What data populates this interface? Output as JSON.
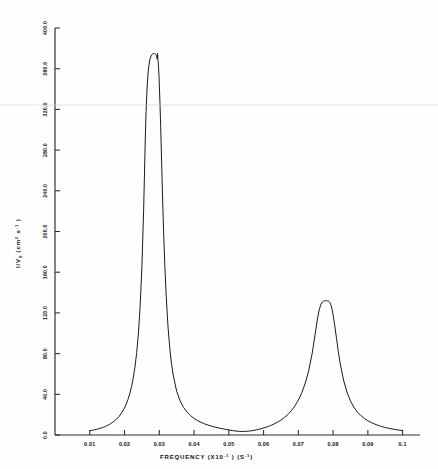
{
  "chart_data": {
    "type": "line",
    "title": "",
    "xlabel": "FREQUENCY (X10-1 ) (S-1)",
    "xlabel_parts": {
      "name": "FREQUENCY",
      "unit_mantissa": "(X10",
      "unit_exp": "-1",
      "unit_close": " )",
      "unit2_open": "(S",
      "unit2_exp": "-1",
      "unit2_close": ")"
    },
    "ylabel": "I/V0 (cm 2 s -1 )",
    "ylabel_parts": {
      "symbol": "I/",
      "subject": "V",
      "subscript": "0",
      "unit_open": " (cm",
      "unit_exp": "2",
      "unit_mid": " s",
      "unit_exp2": "-1",
      "unit_close": " )"
    },
    "xlim": [
      0.0,
      0.105
    ],
    "ylim": [
      0.0,
      400.0
    ],
    "xticks": [
      0.01,
      0.02,
      0.03,
      0.04,
      0.05,
      0.06,
      0.07,
      0.08,
      0.09,
      0.1
    ],
    "xtick_labels": [
      "0.01",
      "0.02",
      "0.03",
      "0.04",
      "0.05",
      "0.06",
      "0.07",
      "0.08",
      "0.09",
      "0.1"
    ],
    "yticks": [
      0.0,
      40.0,
      80.0,
      120.0,
      160.0,
      200.0,
      240.0,
      280.0,
      320.0,
      360.0,
      400.0
    ],
    "ytick_labels": [
      "0.0",
      "40.0",
      "80.0",
      "120.0",
      "160.0",
      "200.0",
      "240.0",
      "280.0",
      "320.0",
      "360.0",
      "400.0"
    ],
    "grid": false,
    "legend": false,
    "series": [
      {
        "name": "spectrum",
        "color": "#1a1a1a",
        "peaks": [
          {
            "center": 0.0295,
            "height": 375.0,
            "hwhm": 0.00125
          },
          {
            "center": 0.0785,
            "height": 132.0,
            "hwhm": 0.00235
          }
        ],
        "x": [
          0.01,
          0.0105,
          0.011,
          0.0115,
          0.012,
          0.0125,
          0.013,
          0.0135,
          0.014,
          0.0145,
          0.015,
          0.0155,
          0.016,
          0.0165,
          0.017,
          0.0175,
          0.018,
          0.0185,
          0.019,
          0.0195,
          0.02,
          0.0205,
          0.021,
          0.0215,
          0.022,
          0.0225,
          0.023,
          0.0235,
          0.024,
          0.0245,
          0.025,
          0.0255,
          0.026,
          0.0262,
          0.0265,
          0.0268,
          0.027,
          0.0273,
          0.0275,
          0.0278,
          0.028,
          0.0282,
          0.0284,
          0.0286,
          0.0288,
          0.029,
          0.0291,
          0.0292,
          0.0293,
          0.0294,
          0.0295,
          0.0296,
          0.0297,
          0.0298,
          0.0299,
          0.03,
          0.0302,
          0.0304,
          0.0306,
          0.0308,
          0.031,
          0.0313,
          0.0316,
          0.032,
          0.0325,
          0.033,
          0.0335,
          0.034,
          0.035,
          0.036,
          0.037,
          0.038,
          0.039,
          0.04,
          0.041,
          0.042,
          0.043,
          0.044,
          0.045,
          0.046,
          0.047,
          0.048,
          0.049,
          0.05,
          0.051,
          0.0515,
          0.052,
          0.053,
          0.054,
          0.055,
          0.056,
          0.057,
          0.058,
          0.059,
          0.06,
          0.061,
          0.062,
          0.063,
          0.064,
          0.065,
          0.066,
          0.067,
          0.068,
          0.069,
          0.07,
          0.071,
          0.072,
          0.073,
          0.074,
          0.075,
          0.0755,
          0.076,
          0.0765,
          0.077,
          0.0773,
          0.0776,
          0.0779,
          0.0781,
          0.0783,
          0.0785,
          0.0787,
          0.0789,
          0.0791,
          0.0794,
          0.0797,
          0.08,
          0.0805,
          0.081,
          0.0815,
          0.082,
          0.083,
          0.084,
          0.085,
          0.086,
          0.087,
          0.088,
          0.089,
          0.09,
          0.091,
          0.092,
          0.093,
          0.094,
          0.095,
          0.096,
          0.097,
          0.098,
          0.099,
          0.1
        ],
        "y": [
          4.2,
          4.5,
          4.8,
          5.2,
          5.6,
          6.0,
          6.5,
          7.1,
          7.7,
          8.4,
          9.2,
          10.1,
          11.1,
          12.2,
          13.5,
          15.0,
          16.7,
          18.6,
          20.9,
          23.6,
          26.7,
          30.5,
          35.0,
          40.5,
          47.3,
          55.8,
          66.7,
          81.0,
          100.2,
          127.0,
          165.0,
          221.0,
          295.0,
          318.0,
          342.0,
          357.0,
          363.0,
          369.0,
          371.5,
          373.5,
          374.3,
          374.8,
          375.0,
          374.9,
          374.6,
          374.0,
          373.4,
          372.6,
          371.4,
          369.4,
          375.0,
          369.4,
          366.0,
          361.0,
          354.0,
          345.0,
          326.0,
          303.0,
          278.0,
          252.0,
          227.0,
          194.0,
          166.0,
          136.0,
          107.0,
          86.0,
          70.5,
          59.0,
          43.0,
          33.5,
          27.0,
          22.5,
          19.0,
          16.3,
          14.2,
          12.4,
          11.0,
          9.8,
          8.7,
          7.8,
          7.0,
          6.3,
          5.6,
          5.0,
          4.4,
          4.1,
          3.9,
          3.6,
          3.5,
          3.6,
          3.9,
          4.4,
          5.1,
          5.9,
          6.9,
          8.0,
          9.3,
          10.8,
          12.6,
          14.7,
          17.2,
          20.2,
          23.9,
          28.5,
          34.2,
          41.5,
          51.0,
          63.5,
          80.5,
          103.0,
          114.0,
          123.0,
          128.5,
          131.0,
          131.7,
          132.0,
          132.0,
          131.9,
          131.8,
          132.0,
          131.6,
          131.0,
          130.0,
          127.5,
          123.5,
          118.0,
          107.0,
          94.5,
          82.0,
          71.0,
          54.0,
          42.0,
          33.5,
          27.2,
          22.5,
          19.0,
          16.2,
          14.0,
          12.2,
          10.7,
          9.4,
          8.3,
          7.4,
          6.6,
          5.9,
          5.3,
          4.8,
          4.3
        ]
      }
    ]
  },
  "layout": {
    "plot_left": 55,
    "plot_right": 420,
    "plot_top": 28,
    "plot_bottom": 435
  }
}
